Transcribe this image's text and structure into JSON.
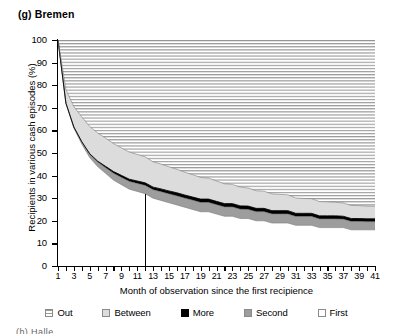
{
  "figure": {
    "label": "(g) Bremen",
    "bottom_partial_text": "(h) Halle"
  },
  "chart_data": {
    "type": "area",
    "title": "(g) Bremen",
    "xlabel": "Month of observation since the first recipience",
    "ylabel": "Recipients in various cash episodes (%)",
    "stacked": true,
    "xlim": [
      1,
      41
    ],
    "ylim": [
      0,
      100
    ],
    "yticks": [
      0,
      10,
      20,
      30,
      40,
      50,
      60,
      70,
      80,
      90,
      100
    ],
    "xticks": [
      1,
      2,
      3,
      4,
      5,
      6,
      7,
      8,
      9,
      10,
      11,
      12,
      13,
      14,
      15,
      16,
      17,
      18,
      19,
      20,
      21,
      22,
      23,
      24,
      25,
      26,
      27,
      28,
      29,
      30,
      31,
      32,
      33,
      34,
      35,
      36,
      37,
      38,
      39,
      40,
      41
    ],
    "xtick_labels": [
      "1",
      "",
      "3",
      "",
      "5",
      "",
      "7",
      "",
      "9",
      "",
      "11",
      "",
      "13",
      "",
      "15",
      "",
      "17",
      "",
      "19",
      "",
      "21",
      "",
      "23",
      "",
      "25",
      "",
      "27",
      "",
      "29",
      "",
      "31",
      "",
      "33",
      "",
      "35",
      "",
      "37",
      "",
      "39",
      "",
      "41"
    ],
    "grid": false,
    "legend_position": "bottom",
    "annotations": [
      {
        "type": "vline",
        "x": 12,
        "y_from": 0,
        "y_to": 32,
        "color": "#000000"
      }
    ],
    "x": [
      1,
      2,
      3,
      4,
      5,
      6,
      7,
      8,
      9,
      10,
      11,
      12,
      13,
      14,
      15,
      16,
      17,
      18,
      19,
      20,
      21,
      22,
      23,
      24,
      25,
      26,
      27,
      28,
      29,
      30,
      31,
      32,
      33,
      34,
      35,
      36,
      37,
      38,
      39,
      40,
      41
    ],
    "series": [
      {
        "name": "First",
        "color": "#ffffff",
        "pattern": "solid",
        "values": [
          100,
          72,
          61,
          54,
          48,
          44,
          41,
          38,
          36,
          34,
          33,
          32,
          30,
          29,
          28,
          27,
          26,
          25,
          24,
          24,
          23,
          22,
          22,
          21,
          21,
          20,
          20,
          19,
          19,
          19,
          18,
          18,
          18,
          17,
          17,
          17,
          17,
          16,
          16,
          16,
          16
        ]
      },
      {
        "name": "Second",
        "color": "#9d9d9d",
        "pattern": "solid",
        "values": [
          0,
          0,
          0.5,
          1,
          1.5,
          2,
          2.5,
          3,
          3.2,
          3.4,
          3.5,
          3.6,
          3.7,
          3.8,
          3.9,
          4,
          4,
          4.1,
          4.1,
          4.1,
          4.1,
          4.1,
          4.1,
          4.1,
          4,
          4,
          4,
          4,
          4,
          4,
          3.9,
          3.9,
          3.9,
          3.8,
          3.8,
          3.8,
          3.7,
          3.7,
          3.7,
          3.6,
          3.6
        ]
      },
      {
        "name": "More",
        "color": "#000000",
        "pattern": "solid",
        "values": [
          0,
          0,
          0,
          0,
          0.2,
          0.4,
          0.6,
          0.8,
          0.9,
          1,
          1.1,
          1.2,
          1.2,
          1.3,
          1.3,
          1.4,
          1.4,
          1.4,
          1.5,
          1.5,
          1.5,
          1.5,
          1.5,
          1.5,
          1.5,
          1.5,
          1.5,
          1.5,
          1.5,
          1.5,
          1.4,
          1.4,
          1.4,
          1.4,
          1.4,
          1.4,
          1.3,
          1.3,
          1.3,
          1.3,
          1.3
        ]
      },
      {
        "name": "Between",
        "color": "#dcdcdc",
        "pattern": "solid",
        "values": [
          0,
          6,
          9,
          11,
          12,
          12.5,
          12.5,
          12.4,
          12.2,
          12,
          11.8,
          11.5,
          11.2,
          11,
          10.7,
          10.4,
          10.1,
          9.9,
          9.6,
          9.3,
          9,
          8.8,
          8.5,
          8.3,
          8,
          7.8,
          7.6,
          7.4,
          7.2,
          7,
          6.8,
          6.6,
          6.5,
          6.3,
          6.2,
          6,
          5.9,
          5.8,
          5.7,
          5.6,
          5.5
        ]
      },
      {
        "name": "Out",
        "color": "#ffffff",
        "pattern": "horizontal-lines",
        "values": [
          0,
          22,
          29.5,
          34,
          38.3,
          41.1,
          43.4,
          45.8,
          47.7,
          49.6,
          50.6,
          51.7,
          53.9,
          54.9,
          56.1,
          57.2,
          58.5,
          59.6,
          60.8,
          61.1,
          62.4,
          63.6,
          63.9,
          65.1,
          65.5,
          66.7,
          66.9,
          68.1,
          68.3,
          68.5,
          69.9,
          70.1,
          70.2,
          71.5,
          71.6,
          71.8,
          72.1,
          73.2,
          73.3,
          73.5,
          73.6
        ]
      }
    ]
  },
  "legend": {
    "items": [
      {
        "label": "Out",
        "swatch": "out-swatch"
      },
      {
        "label": "Between",
        "swatch": "between-swatch"
      },
      {
        "label": "More",
        "swatch": "more-swatch"
      },
      {
        "label": "Second",
        "swatch": "second-swatch"
      },
      {
        "label": "First",
        "swatch": "first-swatch"
      }
    ]
  }
}
